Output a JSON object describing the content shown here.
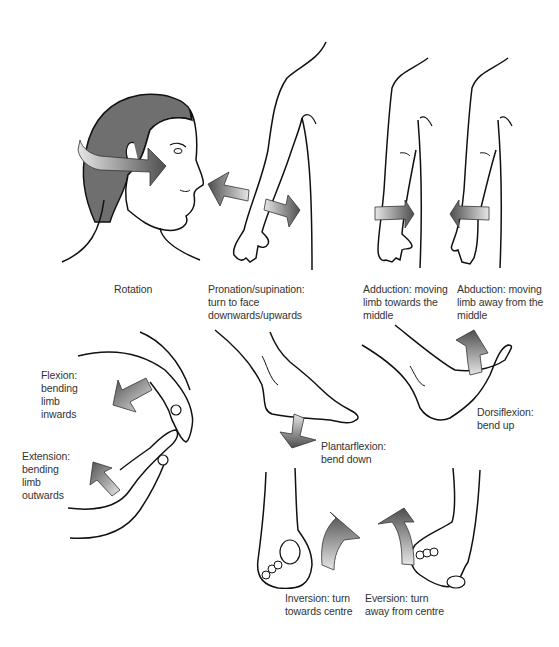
{
  "diagram": {
    "colors": {
      "background": "#ffffff",
      "line": "#111111",
      "hair": "#707070",
      "arrow_dark": "#555555",
      "arrow_light": "#e0e0e0",
      "text": "#333333"
    },
    "panels": [
      {
        "id": "rotation",
        "label": "Rotation"
      },
      {
        "id": "pronation",
        "label": "Pronation/supination:\nturn to face\ndownwards/upwards"
      },
      {
        "id": "adduction",
        "label": "Adduction: moving\nlimb towards the\nmiddle"
      },
      {
        "id": "abduction",
        "label": "Abduction: moving\nlimb away from the\nmiddle"
      },
      {
        "id": "flexion",
        "label": "Flexion:\nbending\nlimb\ninwards"
      },
      {
        "id": "extension",
        "label": "Extension:\nbending\nlimb\noutwards"
      },
      {
        "id": "plantarflexion",
        "label": "Plantarflexion:\nbend down"
      },
      {
        "id": "dorsiflexion",
        "label": "Dorsiflexion:\nbend up"
      },
      {
        "id": "inversion",
        "label": "Inversion: turn\ntowards centre"
      },
      {
        "id": "eversion",
        "label": "Eversion: turn\naway from centre"
      }
    ]
  }
}
